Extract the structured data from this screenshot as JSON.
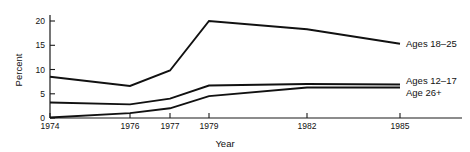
{
  "chart_data": {
    "type": "line",
    "title": "",
    "subtitle": "",
    "xlabel": "Year",
    "ylabel": "Percent",
    "x": [
      1974,
      1976,
      1977,
      1979,
      1982,
      1985
    ],
    "xtick_labels": [
      "1974",
      "1976",
      "1977",
      "1979",
      "1982",
      "1985"
    ],
    "ytick_labels": [
      "0",
      "5",
      "10",
      "15",
      "20"
    ],
    "ytick_values": [
      0,
      5,
      10,
      15,
      20
    ],
    "xlim": [
      1974,
      1985
    ],
    "ylim": [
      0,
      22
    ],
    "grid": false,
    "legend_position": "right-inline-end-of-line",
    "series": [
      {
        "name": "Ages 18–25",
        "label": "Ages 18–25",
        "values": [
          8.5,
          6.6,
          9.8,
          20.0,
          18.3,
          15.3
        ],
        "color": "#111111"
      },
      {
        "name": "Ages 12–17",
        "label": "Ages 12–17",
        "values": [
          3.2,
          2.8,
          4.0,
          6.7,
          7.0,
          6.9
        ],
        "color": "#111111"
      },
      {
        "name": "Age 26+",
        "label": "Age 26+",
        "values": [
          0.1,
          1.0,
          2.0,
          4.5,
          6.3,
          6.3
        ],
        "color": "#111111"
      }
    ]
  },
  "axes": {
    "y_axis_title": "Percent",
    "x_axis_title": "Year",
    "y_ticks": [
      {
        "label": "0",
        "value": 0
      },
      {
        "label": "5",
        "value": 5
      },
      {
        "label": "10",
        "value": 10
      },
      {
        "label": "15",
        "value": 15
      },
      {
        "label": "20",
        "value": 20
      }
    ],
    "x_ticks": [
      {
        "label": "1974",
        "value": 1974
      },
      {
        "label": "1976",
        "value": 1976
      },
      {
        "label": "1977",
        "value": 1977
      },
      {
        "label": "1979",
        "value": 1979
      },
      {
        "label": "1982",
        "value": 1982
      },
      {
        "label": "1985",
        "value": 1985
      }
    ]
  },
  "series_labels": {
    "top": "Ages 18–25",
    "middle": "Ages 12–17",
    "bottom": "Age 26+"
  },
  "colors": {
    "line": "#111111",
    "axis": "#1a1a1a",
    "text": "#111111",
    "background": "#ffffff"
  }
}
